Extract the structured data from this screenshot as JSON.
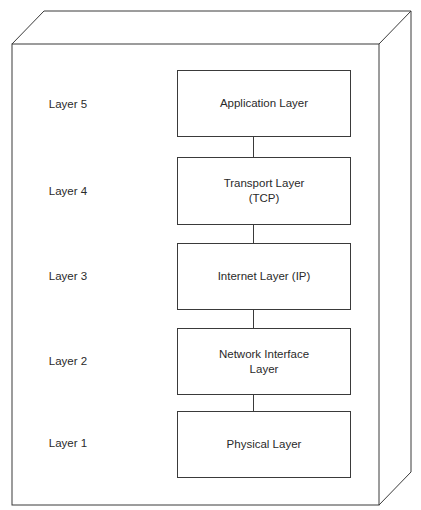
{
  "diagram": {
    "type": "3d-box-layer-stack",
    "layers": [
      {
        "label": "Layer 5",
        "name_line1": "Application Layer",
        "name_line2": ""
      },
      {
        "label": "Layer 4",
        "name_line1": "Transport Layer",
        "name_line2": "(TCP)"
      },
      {
        "label": "Layer 3",
        "name_line1": "Internet Layer (IP)",
        "name_line2": ""
      },
      {
        "label": "Layer 2",
        "name_line1": "Network Interface",
        "name_line2": "Layer"
      },
      {
        "label": "Layer 1",
        "name_line1": "Physical Layer",
        "name_line2": ""
      }
    ],
    "colors": {
      "stroke": "#3a3a3a",
      "background": "#ffffff",
      "text": "#2a2a2a"
    }
  }
}
